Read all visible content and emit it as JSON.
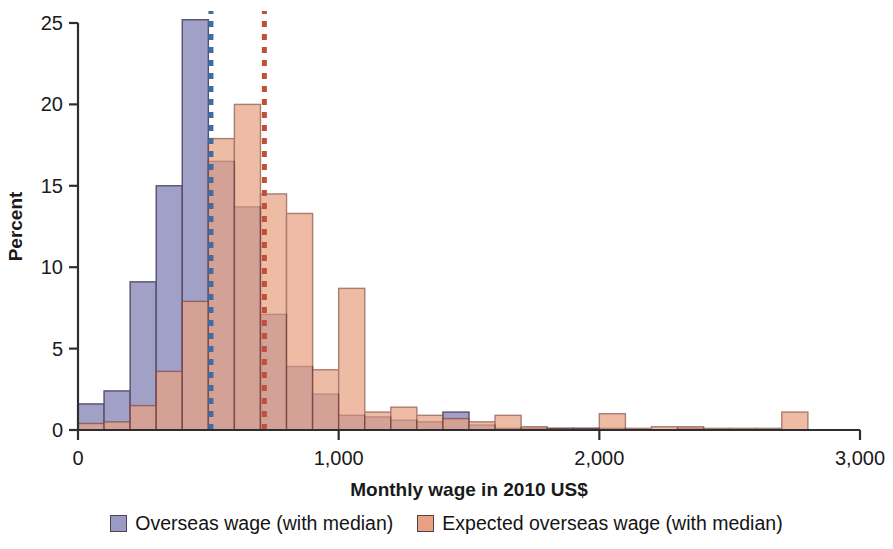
{
  "chart_data": {
    "type": "bar",
    "subtype": "overlaid-histogram",
    "title": "",
    "xlabel": "Monthly wage in 2010 US$",
    "ylabel": "Percent",
    "xlim": [
      0,
      3000
    ],
    "ylim": [
      0,
      25
    ],
    "xticks": [
      0,
      1000,
      2000,
      3000
    ],
    "xtick_labels": [
      "0",
      "1,000",
      "2,000",
      "3,000"
    ],
    "yticks": [
      0,
      5,
      10,
      15,
      20,
      25
    ],
    "ytick_labels": [
      "0",
      "5",
      "10",
      "15",
      "20",
      "25"
    ],
    "grid": false,
    "legend_position": "bottom",
    "bin_width": 100,
    "bin_starts": [
      0,
      100,
      200,
      300,
      400,
      500,
      600,
      700,
      800,
      900,
      1000,
      1100,
      1200,
      1300,
      1400,
      1500,
      1600,
      1700,
      1800,
      1900,
      2000,
      2100,
      2200,
      2300,
      2400,
      2500,
      2600,
      2700,
      2800,
      2900
    ],
    "series": [
      {
        "name": "Overseas wage (with median)",
        "color": "#9a9ac4",
        "edge_color": "#4a3f63",
        "values": [
          1.6,
          2.4,
          9.1,
          15.0,
          25.2,
          16.5,
          13.7,
          7.1,
          3.9,
          2.2,
          0.9,
          0.8,
          0.6,
          0.5,
          1.1,
          0.3,
          0.1,
          0.1,
          0.1,
          0.1,
          0.1,
          0.0,
          0.0,
          0.1,
          0.0,
          0.0,
          0.0,
          0.0,
          0.0,
          0.0
        ],
        "median": 510,
        "median_line_color": "#3b6ea8",
        "median_line_style": "dotted"
      },
      {
        "name": "Expected overseas wage (with median)",
        "color": "#e8a183",
        "edge_color": "#8c4a3a",
        "values": [
          0.4,
          0.5,
          1.5,
          3.6,
          7.9,
          17.9,
          20.0,
          14.5,
          13.3,
          3.7,
          8.7,
          1.1,
          1.4,
          0.9,
          0.7,
          0.5,
          0.9,
          0.2,
          0.1,
          0.1,
          1.0,
          0.1,
          0.2,
          0.2,
          0.1,
          0.1,
          0.1,
          1.1,
          0.0,
          0.0
        ],
        "median": 715,
        "median_line_color": "#c0503a",
        "median_line_style": "dotted"
      }
    ]
  },
  "legend": {
    "items": [
      {
        "label": "Overseas wage (with median)",
        "color": "#9a9ac4"
      },
      {
        "label": "Expected overseas wage (with median)",
        "color": "#e8a183"
      }
    ]
  },
  "axes": {
    "x_title": "Monthly wage in 2010 US$",
    "y_title": "Percent"
  }
}
